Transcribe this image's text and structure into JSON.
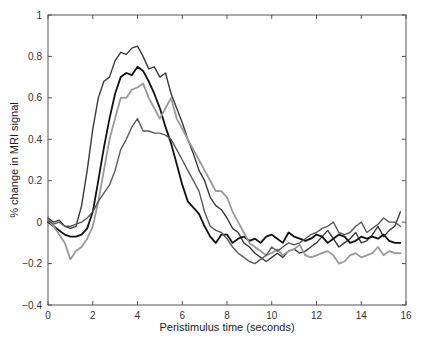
{
  "chart_data": {
    "type": "line",
    "title": "",
    "xlabel": "Peristimulus time (seconds)",
    "ylabel": "% change in MRI signal",
    "xlim": [
      0,
      16
    ],
    "ylim": [
      -0.4,
      1
    ],
    "xticks": [
      0,
      2,
      4,
      6,
      8,
      10,
      12,
      14,
      16
    ],
    "yticks": [
      -0.4,
      -0.2,
      0,
      0.2,
      0.4,
      0.6,
      0.8,
      1
    ],
    "xtick_labels": [
      "0",
      "2",
      "4",
      "6",
      "8",
      "10",
      "12",
      "14",
      "16"
    ],
    "ytick_labels": [
      "−0.4",
      "−0.2",
      "0",
      "0.2",
      "0.4",
      "0.6",
      "0.8",
      "1"
    ],
    "grid": false,
    "legend": null,
    "x": [
      0,
      0.25,
      0.5,
      0.75,
      1,
      1.25,
      1.5,
      1.75,
      2,
      2.25,
      2.5,
      2.75,
      3,
      3.25,
      3.5,
      3.75,
      4,
      4.25,
      4.5,
      4.75,
      5,
      5.25,
      5.5,
      5.75,
      6,
      6.25,
      6.5,
      6.75,
      7,
      7.25,
      7.5,
      7.75,
      8,
      8.25,
      8.5,
      8.75,
      9,
      9.25,
      9.5,
      9.75,
      10,
      10.25,
      10.5,
      10.75,
      11,
      11.25,
      11.5,
      11.75,
      12,
      12.25,
      12.5,
      12.75,
      13,
      13.25,
      13.5,
      13.75,
      14,
      14.25,
      14.5,
      14.75,
      15,
      15.25,
      15.5,
      15.75
    ],
    "series": [
      {
        "name": "series-1",
        "color": "#3a3a3a",
        "width": 1.4,
        "values": [
          0.02,
          0.0,
          0.01,
          -0.02,
          -0.03,
          -0.02,
          0.08,
          0.25,
          0.45,
          0.6,
          0.68,
          0.7,
          0.78,
          0.82,
          0.81,
          0.84,
          0.85,
          0.8,
          0.74,
          0.75,
          0.7,
          0.72,
          0.62,
          0.55,
          0.48,
          0.4,
          0.33,
          0.25,
          0.2,
          0.12,
          0.08,
          0.06,
          0.02,
          -0.03,
          -0.05,
          -0.1,
          -0.12,
          -0.15,
          -0.17,
          -0.19,
          -0.17,
          -0.15,
          -0.17,
          -0.14,
          -0.13,
          -0.15,
          -0.14,
          -0.12,
          -0.1,
          -0.07,
          -0.04,
          -0.08,
          -0.12,
          -0.1,
          -0.08,
          -0.05,
          -0.1,
          -0.09,
          -0.06,
          -0.02,
          -0.07,
          -0.04,
          -0.02,
          0.05
        ]
      },
      {
        "name": "series-2",
        "color": "#111111",
        "width": 1.8,
        "values": [
          0.0,
          -0.02,
          -0.04,
          -0.06,
          -0.07,
          -0.07,
          -0.06,
          -0.03,
          0.05,
          0.2,
          0.36,
          0.5,
          0.62,
          0.7,
          0.72,
          0.71,
          0.75,
          0.73,
          0.68,
          0.62,
          0.55,
          0.46,
          0.38,
          0.28,
          0.18,
          0.1,
          0.07,
          0.04,
          -0.02,
          -0.07,
          -0.1,
          -0.06,
          -0.06,
          -0.1,
          -0.08,
          -0.07,
          -0.09,
          -0.08,
          -0.1,
          -0.07,
          -0.06,
          -0.08,
          -0.1,
          -0.05,
          -0.07,
          -0.08,
          -0.09,
          -0.08,
          -0.06,
          -0.07,
          -0.1,
          -0.08,
          -0.06,
          -0.07,
          -0.1,
          -0.09,
          -0.07,
          -0.08,
          -0.07,
          -0.08,
          -0.06,
          -0.09,
          -0.1,
          -0.1
        ]
      },
      {
        "name": "series-3",
        "color": "#9a9a9a",
        "width": 1.8,
        "values": [
          0.01,
          -0.02,
          -0.06,
          -0.1,
          -0.18,
          -0.14,
          -0.12,
          -0.08,
          -0.02,
          0.1,
          0.25,
          0.4,
          0.5,
          0.6,
          0.6,
          0.64,
          0.65,
          0.67,
          0.6,
          0.55,
          0.5,
          0.55,
          0.6,
          0.5,
          0.45,
          0.4,
          0.35,
          0.3,
          0.25,
          0.2,
          0.15,
          0.15,
          0.12,
          0.05,
          0.0,
          -0.05,
          -0.1,
          -0.12,
          -0.14,
          -0.16,
          -0.15,
          -0.13,
          -0.16,
          -0.14,
          -0.13,
          -0.11,
          -0.16,
          -0.17,
          -0.16,
          -0.15,
          -0.14,
          -0.16,
          -0.2,
          -0.19,
          -0.16,
          -0.15,
          -0.17,
          -0.16,
          -0.15,
          -0.12,
          -0.16,
          -0.14,
          -0.15,
          -0.15
        ]
      },
      {
        "name": "series-4",
        "color": "#5a5a5a",
        "width": 1.4,
        "values": [
          0.01,
          -0.01,
          0.0,
          -0.02,
          -0.02,
          -0.01,
          0.0,
          0.02,
          0.05,
          0.1,
          0.14,
          0.18,
          0.25,
          0.35,
          0.4,
          0.46,
          0.5,
          0.44,
          0.44,
          0.43,
          0.43,
          0.42,
          0.4,
          0.35,
          0.3,
          0.25,
          0.2,
          0.15,
          0.05,
          -0.02,
          -0.04,
          -0.05,
          -0.08,
          -0.12,
          -0.15,
          -0.17,
          -0.19,
          -0.2,
          -0.18,
          -0.16,
          -0.12,
          -0.14,
          -0.12,
          -0.1,
          -0.11,
          -0.1,
          -0.08,
          -0.06,
          -0.05,
          -0.03,
          -0.02,
          0.0,
          -0.05,
          -0.06,
          -0.05,
          -0.02,
          0.0,
          -0.05,
          -0.03,
          -0.01,
          0.02,
          0.0,
          0.0,
          -0.02
        ]
      }
    ]
  }
}
